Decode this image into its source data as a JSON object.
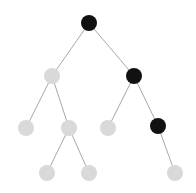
{
  "diagram": {
    "type": "binary-tree",
    "colors": {
      "highlighted": "#111111",
      "default": "#d9d9d9",
      "edge": "#a8a8a8",
      "background": "#ffffff"
    },
    "node_radius": 8,
    "nodes": [
      {
        "id": "root",
        "x": 89,
        "y": 23,
        "state": "highlighted"
      },
      {
        "id": "L",
        "x": 52,
        "y": 76,
        "state": "default"
      },
      {
        "id": "R",
        "x": 134,
        "y": 76,
        "state": "highlighted"
      },
      {
        "id": "LL",
        "x": 26,
        "y": 128,
        "state": "default"
      },
      {
        "id": "LR",
        "x": 69,
        "y": 128,
        "state": "default"
      },
      {
        "id": "RL",
        "x": 108,
        "y": 128,
        "state": "default"
      },
      {
        "id": "RR",
        "x": 158,
        "y": 126,
        "state": "highlighted"
      },
      {
        "id": "LRL",
        "x": 47,
        "y": 173,
        "state": "default"
      },
      {
        "id": "LRR",
        "x": 89,
        "y": 173,
        "state": "default"
      },
      {
        "id": "RRR",
        "x": 175,
        "y": 173,
        "state": "default"
      }
    ],
    "edges": [
      [
        "root",
        "L"
      ],
      [
        "root",
        "R"
      ],
      [
        "L",
        "LL"
      ],
      [
        "L",
        "LR"
      ],
      [
        "LR",
        "LRL"
      ],
      [
        "LR",
        "LRR"
      ],
      [
        "R",
        "RL"
      ],
      [
        "R",
        "RR"
      ],
      [
        "RR",
        "RRR"
      ]
    ]
  }
}
